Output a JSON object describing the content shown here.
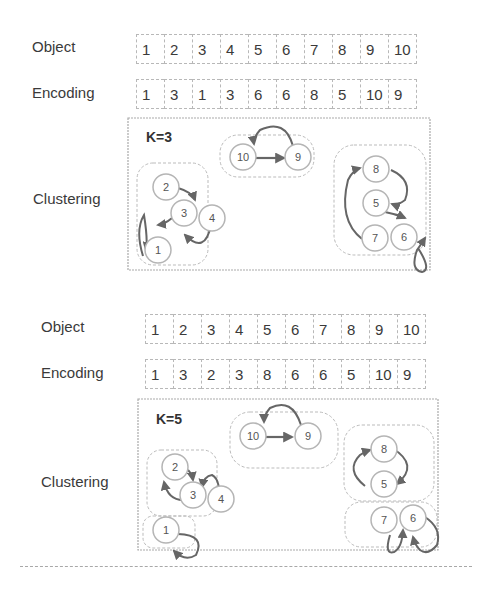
{
  "panels": [
    {
      "object_label": "Object",
      "encoding_label": "Encoding",
      "clustering_label": "Clustering",
      "object_row": [
        "1",
        "2",
        "3",
        "4",
        "5",
        "6",
        "7",
        "8",
        "9",
        "10"
      ],
      "encoding_row": [
        "1",
        "3",
        "1",
        "3",
        "6",
        "6",
        "8",
        "5",
        "10",
        "9"
      ],
      "k_label": "K=3",
      "clusters": [
        {
          "members": [
            "1",
            "2",
            "3",
            "4"
          ]
        },
        {
          "members": [
            "10",
            "9"
          ]
        },
        {
          "members": [
            "8",
            "5",
            "7",
            "6"
          ]
        }
      ],
      "nodes": {
        "n1": "1",
        "n2": "2",
        "n3": "3",
        "n4": "4",
        "n5": "5",
        "n6": "6",
        "n7": "7",
        "n8": "8",
        "n9": "9",
        "n10": "10"
      }
    },
    {
      "object_label": "Object",
      "encoding_label": "Encoding",
      "clustering_label": "Clustering",
      "object_row": [
        "1",
        "2",
        "3",
        "4",
        "5",
        "6",
        "7",
        "8",
        "9",
        "10"
      ],
      "encoding_row": [
        "1",
        "3",
        "2",
        "3",
        "8",
        "6",
        "6",
        "5",
        "10",
        "9"
      ],
      "k_label": "K=5",
      "clusters": [
        {
          "members": [
            "2",
            "3",
            "4"
          ]
        },
        {
          "members": [
            "10",
            "9"
          ]
        },
        {
          "members": [
            "8",
            "5"
          ]
        },
        {
          "members": [
            "1"
          ]
        },
        {
          "members": [
            "7",
            "6"
          ]
        }
      ],
      "nodes": {
        "n1": "1",
        "n2": "2",
        "n3": "3",
        "n4": "4",
        "n5": "5",
        "n6": "6",
        "n7": "7",
        "n8": "8",
        "n9": "9",
        "n10": "10"
      }
    }
  ],
  "colors": {
    "node_stroke": "#b5b5b5",
    "edge": "#666666",
    "dashed": "#c0c0c0"
  }
}
